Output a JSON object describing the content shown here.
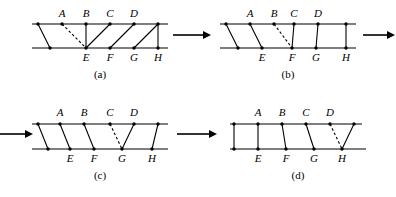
{
  "figure": {
    "type": "diagram",
    "panel_count": 4,
    "top_labels": [
      "A",
      "B",
      "C",
      "D"
    ],
    "bottom_labels": [
      "E",
      "F",
      "G",
      "H"
    ],
    "captions": [
      "(a)",
      "(b)",
      "(c)",
      "(d)"
    ],
    "arrow_glyph": "arrow-right",
    "colors": {
      "ink": "#000000",
      "paper": "#ffffff"
    }
  },
  "panels": [
    {
      "id": "panel-a",
      "caption": "(a)",
      "top_labels": [
        "A",
        "B",
        "C",
        "D"
      ],
      "bottom_labels": [
        "E",
        "F",
        "G",
        "H"
      ],
      "top_nodes_x": [
        10,
        34,
        58,
        82,
        106,
        130
      ],
      "bottom_nodes_x": [
        22,
        58,
        82,
        106,
        130
      ],
      "top_label_nodes": [
        1,
        2,
        3,
        4
      ],
      "bottom_label_nodes": [
        1,
        2,
        3,
        4
      ],
      "edges": [
        {
          "from_top": 0,
          "to_bottom": 0,
          "dashed": false
        },
        {
          "from_top": 1,
          "to_bottom": 1,
          "dashed": true
        },
        {
          "from_top": 2,
          "to_bottom": 1,
          "dashed": false
        },
        {
          "from_top": 3,
          "to_bottom": 2,
          "dashed": false
        },
        {
          "from_top": 4,
          "to_bottom": 3,
          "dashed": false
        },
        {
          "from_top": 5,
          "to_bottom": 4,
          "dashed": false
        }
      ],
      "dashed_edge": "A-E"
    },
    {
      "id": "panel-b",
      "caption": "(b)",
      "top_labels": [
        "A",
        "B",
        "C",
        "D"
      ],
      "bottom_labels": [
        "E",
        "F",
        "G",
        "H"
      ],
      "top_nodes_x": [
        10,
        34,
        58,
        76,
        100,
        130
      ],
      "bottom_nodes_x": [
        22,
        46,
        76,
        100,
        130
      ],
      "top_label_nodes": [
        1,
        2,
        3,
        4
      ],
      "bottom_label_nodes": [
        1,
        2,
        3,
        4
      ],
      "edges": [
        {
          "from_top": 0,
          "to_bottom": 0,
          "dashed": false
        },
        {
          "from_top": 1,
          "to_bottom": 1,
          "dashed": false
        },
        {
          "from_top": 2,
          "to_bottom": 2,
          "dashed": true
        },
        {
          "from_top": 3,
          "to_bottom": 2,
          "dashed": false
        },
        {
          "from_top": 4,
          "to_bottom": 3,
          "dashed": false
        },
        {
          "from_top": 5,
          "to_bottom": 4,
          "dashed": false
        }
      ],
      "dashed_edge": "B-F"
    },
    {
      "id": "panel-c",
      "caption": "(c)",
      "top_labels": [
        "A",
        "B",
        "C",
        "D"
      ],
      "bottom_labels": [
        "E",
        "F",
        "G",
        "H"
      ],
      "top_nodes_x": [
        10,
        32,
        56,
        82,
        104,
        130
      ],
      "bottom_nodes_x": [
        20,
        42,
        66,
        94,
        124
      ],
      "top_label_nodes": [
        1,
        2,
        3,
        4
      ],
      "bottom_label_nodes": [
        1,
        2,
        3,
        4
      ],
      "edges": [
        {
          "from_top": 0,
          "to_bottom": 0,
          "dashed": false
        },
        {
          "from_top": 1,
          "to_bottom": 1,
          "dashed": false
        },
        {
          "from_top": 2,
          "to_bottom": 2,
          "dashed": false
        },
        {
          "from_top": 3,
          "to_bottom": 3,
          "dashed": true
        },
        {
          "from_top": 4,
          "to_bottom": 3,
          "dashed": false
        },
        {
          "from_top": 5,
          "to_bottom": 4,
          "dashed": false
        }
      ],
      "dashed_edge": "C-G"
    },
    {
      "id": "panel-d",
      "caption": "(d)",
      "top_labels": [
        "A",
        "B",
        "C",
        "D"
      ],
      "bottom_labels": [
        "E",
        "F",
        "G",
        "H"
      ],
      "top_nodes_x": [
        8,
        32,
        56,
        80,
        104,
        128
      ],
      "bottom_nodes_x": [
        8,
        32,
        60,
        88,
        116
      ],
      "top_label_nodes": [
        1,
        2,
        3,
        4
      ],
      "bottom_label_nodes": [
        1,
        2,
        3,
        4
      ],
      "edges": [
        {
          "from_top": 0,
          "to_bottom": 0,
          "dashed": false
        },
        {
          "from_top": 1,
          "to_bottom": 1,
          "dashed": false
        },
        {
          "from_top": 2,
          "to_bottom": 2,
          "dashed": false
        },
        {
          "from_top": 3,
          "to_bottom": 3,
          "dashed": false
        },
        {
          "from_top": 4,
          "to_bottom": 4,
          "dashed": true
        },
        {
          "from_top": 5,
          "to_bottom": 4,
          "dashed": false
        }
      ],
      "dashed_edge": "D-H"
    }
  ],
  "arrows": [
    {
      "id": "arrow-a-to-b",
      "direction": "right"
    },
    {
      "id": "arrow-b-to-next",
      "direction": "right"
    },
    {
      "id": "arrow-into-c",
      "direction": "right"
    },
    {
      "id": "arrow-c-to-d",
      "direction": "right"
    }
  ]
}
